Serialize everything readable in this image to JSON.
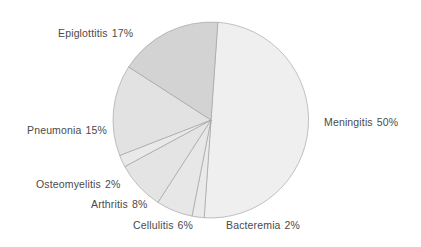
{
  "chart_data": {
    "type": "pie",
    "title": "",
    "subtitle": "",
    "xlabel": "",
    "ylabel": "",
    "legend_position": "none",
    "grid": false,
    "labels_inline": true,
    "unit": "%",
    "categories": [
      "Meningitis",
      "Bacteremia",
      "Cellulitis",
      "Arthritis",
      "Osteomyelitis",
      "Pneumonia",
      "Epiglottitis"
    ],
    "values": [
      50,
      2,
      6,
      8,
      2,
      15,
      17
    ],
    "start_angle_deg": -86,
    "direction": "clockwise",
    "slices": [
      {
        "name": "Meningitis",
        "value": 50,
        "label": "Meningitis",
        "percent_text": "50%",
        "full_label": "Meningitis  50%",
        "color": "#efefef",
        "label_x": 324,
        "label_y": 117,
        "label_align": "left"
      },
      {
        "name": "Bacteremia",
        "value": 2,
        "label": "Bacteremia",
        "percent_text": "2%",
        "full_label": "Bacteremia  2%",
        "color": "#eaeaea",
        "label_x": 226,
        "label_y": 220,
        "label_align": "left"
      },
      {
        "name": "Cellulitis",
        "value": 6,
        "label": "Cellulitis",
        "percent_text": "6%",
        "full_label": "Cellulitis  6%",
        "color": "#e7e7e7",
        "label_x": 133,
        "label_y": 220,
        "label_align": "left"
      },
      {
        "name": "Arthritis",
        "value": 8,
        "label": "Arthritis",
        "percent_text": "8%",
        "full_label": "Arthritis  8%",
        "color": "#e4e4e4",
        "label_x": 91,
        "label_y": 199,
        "label_align": "left"
      },
      {
        "name": "Osteomyelitis",
        "value": 2,
        "label": "Osteomyelitis",
        "percent_text": "2%",
        "full_label": "Osteomyelitis  2%",
        "color": "#e9e9e9",
        "label_x": 36,
        "label_y": 179,
        "label_align": "left"
      },
      {
        "name": "Pneumonia",
        "value": 15,
        "label": "Pneumonia",
        "percent_text": "15%",
        "full_label": "Pneumonia  15%",
        "color": "#e2e2e2",
        "label_x": 27,
        "label_y": 125,
        "label_align": "left"
      },
      {
        "name": "Epiglottitis",
        "value": 17,
        "label": "Epiglottitis",
        "percent_text": "17%",
        "full_label": "Epiglottitis  17%",
        "color": "#d3d3d3",
        "label_x": 58,
        "label_y": 28,
        "label_align": "left"
      }
    ],
    "geometry": {
      "center_x": 211,
      "center_y": 120,
      "radius": 98
    },
    "colors": {
      "background": "#ffffff",
      "slice_border": "#9a9a9a",
      "label_text": "#4a4a4a"
    }
  }
}
